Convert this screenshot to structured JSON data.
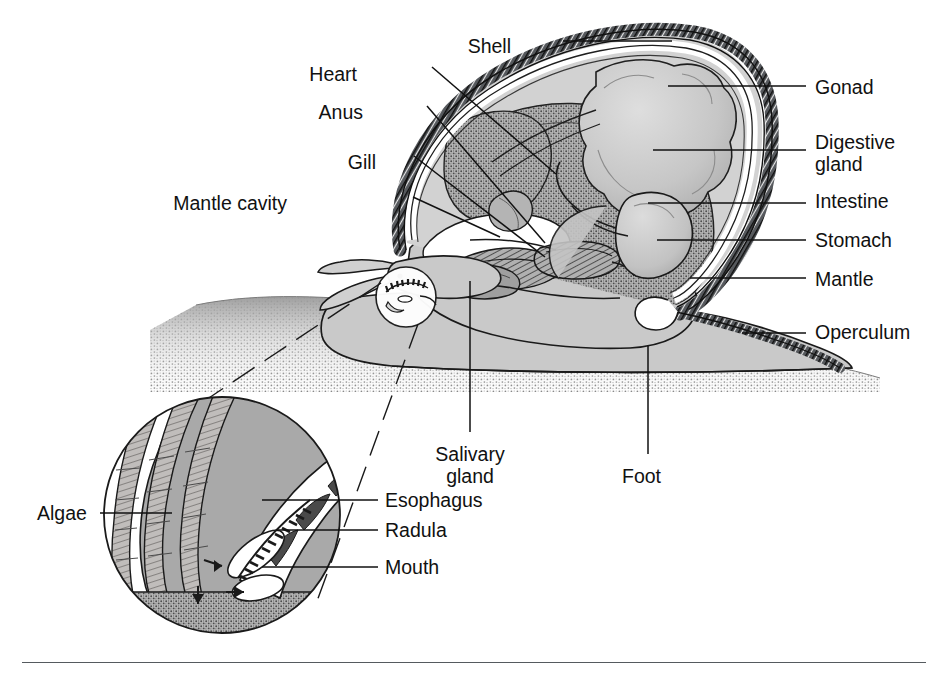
{
  "figure": {
    "kind": "anatomical-diagram",
    "background_color": "#ffffff",
    "ink_color": "#111111",
    "rule_color": "#555a5e"
  },
  "labels": [
    {
      "id": "shell",
      "text": "Shell",
      "x": 511,
      "y": 46,
      "align": "right"
    },
    {
      "id": "heart",
      "text": "Heart",
      "x": 357,
      "y": 74,
      "align": "right"
    },
    {
      "id": "anus",
      "text": "Anus",
      "x": 363,
      "y": 112,
      "align": "right"
    },
    {
      "id": "gill",
      "text": "Gill",
      "x": 376,
      "y": 162,
      "align": "right"
    },
    {
      "id": "mantle-cavity",
      "text": "Mantle cavity",
      "x": 287,
      "y": 203,
      "align": "right"
    },
    {
      "id": "gonad",
      "text": "Gonad",
      "x": 815,
      "y": 76,
      "align": "left"
    },
    {
      "id": "digestive-gland",
      "text": "Digestive\ngland",
      "x": 815,
      "y": 131,
      "align": "left"
    },
    {
      "id": "intestine",
      "text": "Intestine",
      "x": 815,
      "y": 190,
      "align": "left"
    },
    {
      "id": "stomach",
      "text": "Stomach",
      "x": 815,
      "y": 229,
      "align": "left"
    },
    {
      "id": "mantle",
      "text": "Mantle",
      "x": 815,
      "y": 268,
      "align": "left"
    },
    {
      "id": "operculum",
      "text": "Operculum",
      "x": 815,
      "y": 317,
      "align": "left"
    },
    {
      "id": "salivary-gland",
      "text": "Salivary\ngland",
      "x": 440,
      "y": 443,
      "align": "left"
    },
    {
      "id": "foot",
      "text": "Foot",
      "x": 634,
      "y": 465,
      "align": "left"
    },
    {
      "id": "esophagus",
      "text": "Esophagus",
      "x": 385,
      "y": 494,
      "align": "left"
    },
    {
      "id": "radula",
      "text": "Radula",
      "x": 385,
      "y": 524,
      "align": "left"
    },
    {
      "id": "mouth",
      "text": "Mouth",
      "x": 385,
      "y": 561,
      "align": "left"
    },
    {
      "id": "algae",
      "text": "Algae",
      "x": 37,
      "y": 507,
      "align": "left"
    }
  ],
  "structures": [
    {
      "id": "shell",
      "description": "Coiled shell with dark cross-hatched outer band and pale inner lining"
    },
    {
      "id": "gonad",
      "description": "Lobed light-gray reproductive mass at shell apex"
    },
    {
      "id": "digestive-gland",
      "description": "Large dark stippled gland filling the shell whorl"
    },
    {
      "id": "stomach",
      "description": "Smooth pale-gray sac below the digestive gland"
    },
    {
      "id": "intestine",
      "description": "Tube leading from stomach toward the anus"
    },
    {
      "id": "gill",
      "description": "Feather-like hatched ctenidium inside the mantle cavity"
    },
    {
      "id": "heart",
      "description": "Small chamber above the gill"
    },
    {
      "id": "mantle-cavity",
      "description": "White void beneath the mantle holding the gill"
    },
    {
      "id": "mantle",
      "description": "Tissue layer lining the inside of the shell"
    },
    {
      "id": "operculum",
      "description": "Dark hatched horny plate on the rear of the foot"
    },
    {
      "id": "foot",
      "description": "Broad pale muscular foot resting on the substrate"
    },
    {
      "id": "head",
      "description": "Head with two eye-stalk tentacles at the front"
    },
    {
      "id": "substrate",
      "description": "Stippled ground surface under the snail"
    }
  ],
  "inset": {
    "id": "radula-inset",
    "shape": "circle",
    "center_x": 222,
    "center_y": 515,
    "radius": 118,
    "description": "Magnified view of the mouth region showing algae strands being scraped by the toothed radula",
    "callout_circle": {
      "center_x": 406,
      "center_y": 297,
      "radius": 30
    },
    "contents": [
      "algae filaments",
      "esophagus",
      "radula with sawtooth teeth",
      "mouth opening",
      "substrate"
    ]
  },
  "palette": {
    "body_fill": "#c9c9c9",
    "organ_light": "#c4c4c4",
    "organ_mid": "#a9a9a9",
    "organ_dark": "#8e8e8e",
    "shell_band": "#3a3a3a",
    "line": "#111111",
    "white": "#ffffff"
  }
}
